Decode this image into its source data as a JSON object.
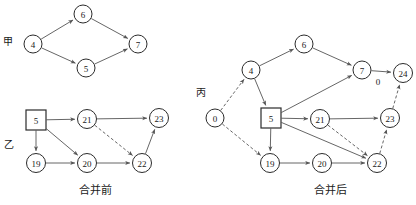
{
  "figure": {
    "width": 416,
    "height": 205,
    "background": "#ffffff",
    "stroke_color": "#555555",
    "node_stroke": "#2b2b2b",
    "text_color": "#1a1a1a"
  },
  "panels": {
    "left": {
      "caption": "合并前",
      "caption_pos": {
        "x": 95,
        "y": 190
      },
      "groups": [
        {
          "name": "jia",
          "label": "甲",
          "pos": {
            "x": 8,
            "y": 41
          }
        },
        {
          "name": "yi",
          "label": "乙",
          "pos": {
            "x": 9,
            "y": 144
          }
        }
      ],
      "nodes": [
        {
          "id": "L4",
          "label": "4",
          "shape": "circle",
          "x": 33,
          "y": 44,
          "r": 9
        },
        {
          "id": "L6",
          "label": "6",
          "shape": "circle",
          "x": 83,
          "y": 14,
          "r": 9
        },
        {
          "id": "L5t",
          "label": "5",
          "shape": "circle",
          "x": 86,
          "y": 68,
          "r": 9
        },
        {
          "id": "L7",
          "label": "7",
          "shape": "circle",
          "x": 138,
          "y": 44,
          "r": 9
        },
        {
          "id": "L5s",
          "label": "5",
          "shape": "square",
          "x": 36,
          "y": 120,
          "r": 10
        },
        {
          "id": "L21",
          "label": "21",
          "shape": "circle",
          "x": 87,
          "y": 119,
          "r": 9.5
        },
        {
          "id": "L23",
          "label": "23",
          "shape": "circle",
          "x": 159,
          "y": 118,
          "r": 9.5
        },
        {
          "id": "L19",
          "label": "19",
          "shape": "circle",
          "x": 36,
          "y": 163,
          "r": 9.5
        },
        {
          "id": "L20",
          "label": "20",
          "shape": "circle",
          "x": 87,
          "y": 163,
          "r": 9.5
        },
        {
          "id": "L22",
          "label": "22",
          "shape": "circle",
          "x": 142,
          "y": 163,
          "r": 9.5
        }
      ],
      "edges": [
        {
          "from": "L4",
          "to": "L6",
          "style": "solid",
          "arrow": true
        },
        {
          "from": "L4",
          "to": "L5t",
          "style": "solid",
          "arrow": true
        },
        {
          "from": "L6",
          "to": "L7",
          "style": "solid",
          "arrow": true
        },
        {
          "from": "L5t",
          "to": "L7",
          "style": "solid",
          "arrow": true
        },
        {
          "from": "L5s",
          "to": "L21",
          "style": "solid",
          "arrow": true
        },
        {
          "from": "L5s",
          "to": "L19",
          "style": "solid",
          "arrow": true
        },
        {
          "from": "L5s",
          "to": "L20",
          "style": "solid",
          "arrow": true
        },
        {
          "from": "L21",
          "to": "L23",
          "style": "solid",
          "arrow": true
        },
        {
          "from": "L21",
          "to": "L22",
          "style": "dashed",
          "arrow": true
        },
        {
          "from": "L19",
          "to": "L20",
          "style": "solid",
          "arrow": true
        },
        {
          "from": "L20",
          "to": "L22",
          "style": "solid",
          "arrow": true
        },
        {
          "from": "L22",
          "to": "L23",
          "style": "solid",
          "arrow": true
        }
      ],
      "edge_weights": []
    },
    "right": {
      "caption": "合并后",
      "caption_pos": {
        "x": 330,
        "y": 190
      },
      "groups": [
        {
          "name": "bing",
          "label": "丙",
          "pos": {
            "x": 201,
            "y": 92
          }
        }
      ],
      "nodes": [
        {
          "id": "R0",
          "label": "0",
          "shape": "circle",
          "x": 215,
          "y": 118,
          "r": 9
        },
        {
          "id": "R4",
          "label": "4",
          "shape": "circle",
          "x": 251,
          "y": 70,
          "r": 9
        },
        {
          "id": "R6",
          "label": "6",
          "shape": "circle",
          "x": 304,
          "y": 44,
          "r": 9
        },
        {
          "id": "R7",
          "label": "7",
          "shape": "circle",
          "x": 362,
          "y": 70,
          "r": 9
        },
        {
          "id": "R24",
          "label": "24",
          "shape": "circle",
          "x": 403,
          "y": 73,
          "r": 9.5
        },
        {
          "id": "R5",
          "label": "5",
          "shape": "square",
          "x": 271,
          "y": 118,
          "r": 10
        },
        {
          "id": "R21",
          "label": "21",
          "shape": "circle",
          "x": 320,
          "y": 119,
          "r": 9.5
        },
        {
          "id": "R23",
          "label": "23",
          "shape": "circle",
          "x": 390,
          "y": 118,
          "r": 9.5
        },
        {
          "id": "R19",
          "label": "19",
          "shape": "circle",
          "x": 270,
          "y": 163,
          "r": 9.5
        },
        {
          "id": "R20",
          "label": "20",
          "shape": "circle",
          "x": 322,
          "y": 163,
          "r": 9.5
        },
        {
          "id": "R22",
          "label": "22",
          "shape": "circle",
          "x": 377,
          "y": 163,
          "r": 9.5
        }
      ],
      "edges": [
        {
          "from": "R0",
          "to": "R4",
          "style": "dashed",
          "arrow": true
        },
        {
          "from": "R0",
          "to": "R19",
          "style": "dashed",
          "arrow": true
        },
        {
          "from": "R4",
          "to": "R6",
          "style": "solid",
          "arrow": true
        },
        {
          "from": "R4",
          "to": "R5",
          "style": "solid",
          "arrow": true
        },
        {
          "from": "R6",
          "to": "R7",
          "style": "solid",
          "arrow": true
        },
        {
          "from": "R5",
          "to": "R7",
          "style": "solid",
          "arrow": true
        },
        {
          "from": "R7",
          "to": "R24",
          "style": "solid",
          "arrow": true
        },
        {
          "from": "R5",
          "to": "R21",
          "style": "solid",
          "arrow": true
        },
        {
          "from": "R5",
          "to": "R19",
          "style": "solid",
          "arrow": true
        },
        {
          "from": "R5",
          "to": "R22",
          "style": "solid",
          "arrow": true
        },
        {
          "from": "R21",
          "to": "R23",
          "style": "solid",
          "arrow": true
        },
        {
          "from": "R21",
          "to": "R22",
          "style": "dashed",
          "arrow": true
        },
        {
          "from": "R19",
          "to": "R20",
          "style": "solid",
          "arrow": true
        },
        {
          "from": "R20",
          "to": "R22",
          "style": "solid",
          "arrow": true
        },
        {
          "from": "R22",
          "to": "R23",
          "style": "dashed",
          "arrow": true
        },
        {
          "from": "R23",
          "to": "R24",
          "style": "dashed",
          "arrow": true
        }
      ],
      "edge_weights": [
        {
          "label": "0",
          "x": 378,
          "y": 82
        }
      ]
    }
  }
}
